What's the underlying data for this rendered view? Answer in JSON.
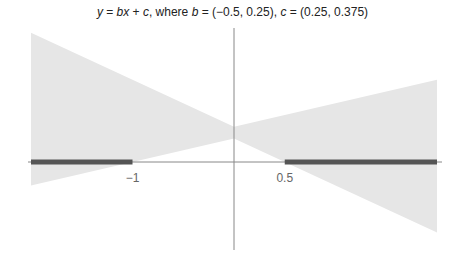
{
  "chart_data": {
    "type": "area",
    "title": "y = bx + c, where b = (−0.5, 0.25), c = (0.25, 0.375)",
    "title_parts": {
      "y": "y",
      "eq": " = ",
      "b": "b",
      "x": "x",
      "plus": " + ",
      "c": "c",
      "where": ", where ",
      "b2": "b",
      "b_range": " = (−0.5, 0.25), ",
      "c2": "c",
      "c_range": " = (0.25, 0.375)"
    },
    "xlabel": "",
    "ylabel": "",
    "xlim": [
      -2,
      2
    ],
    "ylim": [
      -0.95,
      1.4
    ],
    "grid": false,
    "x_ticks": [
      {
        "value": -1,
        "label": "−1"
      },
      {
        "value": 0.5,
        "label": "0.5"
      }
    ],
    "b_range": [
      -0.5,
      0.25
    ],
    "c_range": [
      0.25,
      0.375
    ],
    "shaded_region": {
      "description": "Set of y = bx + c over all b in (-0.5,0.25), c in (0.25,0.375)",
      "upper": [
        [
          -2,
          1.375
        ],
        [
          0,
          0.375
        ],
        [
          2,
          0.875
        ]
      ],
      "lower": [
        [
          -2,
          -0.25
        ],
        [
          0,
          0.25
        ],
        [
          2,
          -0.75
        ]
      ]
    },
    "highlighted_intervals": [
      {
        "from": -2,
        "to": -1
      },
      {
        "from": 0.5,
        "to": 2
      }
    ],
    "colors": {
      "shade": "#e6e6e6",
      "highlight": "#555555",
      "axis": "#888888"
    }
  }
}
